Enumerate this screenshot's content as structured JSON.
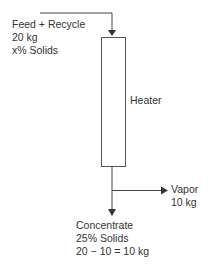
{
  "feed": {
    "lines": [
      "Feed + Recycle",
      "20 kg",
      "x% Solids"
    ]
  },
  "unit": {
    "label": "Heater"
  },
  "vapor": {
    "lines": [
      "Vapor",
      "10 kg"
    ]
  },
  "concentrate": {
    "lines": [
      "Concentrate",
      "25% Solids",
      "20 − 10 = 10 kg"
    ]
  },
  "colors": {
    "line": "#444444",
    "text": "#333333"
  }
}
